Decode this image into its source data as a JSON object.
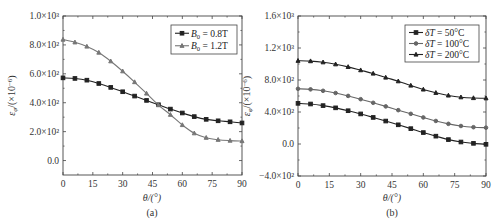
{
  "chart_data": [
    {
      "panel": "(a)",
      "type": "line",
      "xlabel": "θ/(°)",
      "ylabel": "εφ/(×10⁻⁶)",
      "xlim": [
        0,
        90
      ],
      "ylim": [
        -100,
        1000
      ],
      "xticks": [
        0,
        15,
        30,
        45,
        60,
        75,
        90
      ],
      "yticks": [
        0,
        200,
        400,
        600,
        800,
        1000
      ],
      "ytick_labels": [
        "0.0",
        "2.0×10²",
        "4.0×10²",
        "6.0×10²",
        "8.0×10²",
        "1.0×10³"
      ],
      "legend_position": "upper right",
      "x": [
        0,
        6,
        12,
        18,
        24,
        30,
        36,
        42,
        48,
        54,
        60,
        66,
        72,
        78,
        84,
        90
      ],
      "series": [
        {
          "name": "B0 = 0.8T",
          "label_main": "B",
          "label_sub": "0",
          "label_rest": " = 0.8T",
          "marker": "square",
          "color": "#222222",
          "values": [
            572,
            568,
            556,
            533,
            506,
            476,
            446,
            416,
            386,
            356,
            329,
            304,
            285,
            275,
            268,
            260
          ]
        },
        {
          "name": "B0 = 1.2T",
          "label_main": "B",
          "label_sub": "0",
          "label_rest": " = 1.2T",
          "marker": "triangle",
          "color": "#777777",
          "values": [
            837,
            818,
            789,
            747,
            687,
            618,
            543,
            464,
            384,
            317,
            246,
            189,
            158,
            144,
            138,
            135
          ]
        }
      ]
    },
    {
      "panel": "(b)",
      "type": "line",
      "xlabel": "θ/(°)",
      "ylabel": "εφ/(×10⁻⁶)",
      "xlim": [
        0,
        90
      ],
      "ylim": [
        -400,
        1600
      ],
      "xticks": [
        0,
        15,
        30,
        45,
        60,
        75,
        90
      ],
      "yticks": [
        -400,
        0,
        400,
        800,
        1200,
        1600
      ],
      "ytick_labels": [
        "−4.0×10²",
        "0.0",
        "4.0×10²",
        "8.0×10²",
        "1.2×10³",
        "1.6×10³"
      ],
      "legend_position": "upper right",
      "x": [
        0,
        6,
        12,
        18,
        24,
        30,
        36,
        42,
        48,
        54,
        60,
        66,
        72,
        78,
        84,
        90
      ],
      "series": [
        {
          "name": "δT = 50°C",
          "label_main": "δT",
          "label_sub": "",
          "label_rest": " = 50°C",
          "marker": "square",
          "color": "#222222",
          "values": [
            508,
            500,
            480,
            452,
            416,
            376,
            332,
            287,
            240,
            192,
            143,
            98,
            55,
            25,
            8,
            -4
          ]
        },
        {
          "name": "δT = 100°C",
          "label_main": "δT",
          "label_sub": "",
          "label_rest": " = 100°C",
          "marker": "circle",
          "color": "#666666",
          "values": [
            690,
            683,
            665,
            637,
            601,
            560,
            515,
            470,
            423,
            377,
            332,
            288,
            252,
            225,
            210,
            204
          ]
        },
        {
          "name": "δT = 200°C",
          "label_main": "δT",
          "label_sub": "",
          "label_rest": " = 200°C",
          "marker": "triangle",
          "color": "#222222",
          "values": [
            1041,
            1036,
            1022,
            997,
            964,
            923,
            881,
            831,
            785,
            731,
            682,
            640,
            607,
            585,
            575,
            572
          ]
        }
      ]
    }
  ],
  "figure": {
    "panel_a_label": "(a)",
    "panel_b_label": "(b)",
    "xlabel_a": "θ/(°)",
    "xlabel_b": "θ/(°)",
    "ylabel_main": "ε",
    "ylabel_sub": "φ",
    "ylabel_rest": "/(×10",
    "ylabel_exp": "−6",
    "ylabel_close": ")"
  }
}
